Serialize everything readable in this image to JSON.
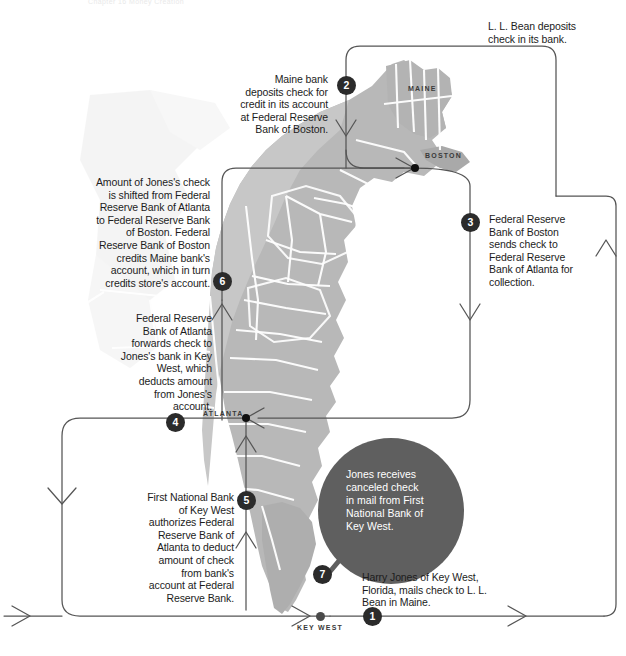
{
  "header": {
    "crumb": "Chapter 16     Money Creation"
  },
  "figure": {
    "bubble_text": "Jones receives\ncanceled check\nin mail from First\nNational Bank of\nKey West."
  },
  "steps": [
    {
      "number": "1",
      "name": "step-1",
      "text": "Harry Jones of Key West,\nFlorida, mails check to L. L.\nBean in Maine.",
      "align": "left"
    },
    {
      "number": "2",
      "name": "step-2",
      "text": "Maine bank\ndeposits check for\ncredit in its account\nat Federal Reserve\nBank of Boston.",
      "align": "right"
    },
    {
      "number": "3",
      "name": "step-3",
      "text": "Federal Reserve\nBank of Boston\nsends check to\nFederal Reserve\nBank of Atlanta for\ncollection.",
      "align": "left"
    },
    {
      "number": "4",
      "name": "step-4",
      "text": "Federal Reserve\nBank of Atlanta\nforwards check to\nJones's bank in Key\nWest, which\ndeducts amount\nfrom Jones's\naccount.",
      "align": "right"
    },
    {
      "number": "5",
      "name": "step-5",
      "text": "First National Bank\nof Key West\nauthorizes Federal\nReserve Bank of\nAtlanta to deduct\namount of check\nfrom bank's\naccount at Federal\nReserve Bank.",
      "align": "right"
    },
    {
      "number": "6",
      "name": "step-6",
      "text": "Amount of Jones's check\nis shifted from Federal\nReserve Bank of Atlanta\nto Federal Reserve Bank\nof Boston.  Federal\nReserve Bank of Boston\ncredits Maine bank's\naccount, which in turn\ncredits store's account.",
      "align": "right"
    },
    {
      "number": "7",
      "name": "step-7",
      "text": "L. L. Bean deposits\ncheck in its bank.",
      "align": "left"
    }
  ],
  "annotations": {
    "ll_bean": "L. L. Bean deposits\ncheck in its bank."
  },
  "map_labels": [
    {
      "name": "map-label-maine",
      "text": "MAINE"
    },
    {
      "name": "map-label-boston",
      "text": "BOSTON"
    },
    {
      "name": "map-label-atlanta",
      "text": "ATLANTA"
    },
    {
      "name": "map-label-key-west",
      "text": "KEY WEST"
    }
  ],
  "colors": {
    "map_fill": "#b9b9b9",
    "map_fill_light": "#d0d0d0",
    "map_border": "#ffffff",
    "flow_line": "#555555",
    "marker_fill": "#2b2b2b",
    "bubble_fill": "#5f5f5f",
    "text": "#1c1c1c"
  }
}
